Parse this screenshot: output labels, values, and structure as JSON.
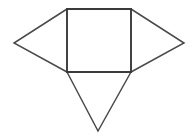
{
  "figure": {
    "name": "geometric-net-figure",
    "background_color": "#ffffff",
    "stroke_color": "#3a3a3a",
    "stroke_color_thin": "#4a4a4a",
    "stroke_width_square": 1.9,
    "stroke_width_triangle": 1.5,
    "canvas": {
      "width": 194,
      "height": 138
    },
    "vertices": {
      "square_top_left": {
        "x": 67,
        "y": 9
      },
      "square_top_right": {
        "x": 131,
        "y": 9
      },
      "square_bottom_right": {
        "x": 131,
        "y": 72
      },
      "square_bottom_left": {
        "x": 67,
        "y": 72
      },
      "left_wing_apex": {
        "x": 14,
        "y": 43
      },
      "right_wing_apex": {
        "x": 184,
        "y": 43
      },
      "bottom_apex": {
        "x": 98,
        "y": 131
      }
    },
    "parts": [
      {
        "name": "square",
        "type": "polygon",
        "points": "67,9 131,9 131,72 67,72",
        "stroke": "#3a3a3a",
        "stroke_width": 1.9
      },
      {
        "name": "left-triangle",
        "type": "polyline",
        "points": "67,9 14,43 67,72",
        "stroke": "#4a4a4a",
        "stroke_width": 1.5
      },
      {
        "name": "right-triangle",
        "type": "polyline",
        "points": "131,9 184,43 131,72",
        "stroke": "#4a4a4a",
        "stroke_width": 1.5
      },
      {
        "name": "bottom-triangle",
        "type": "polyline",
        "points": "67,72 98,131 131,72",
        "stroke": "#4a4a4a",
        "stroke_width": 1.5
      }
    ]
  }
}
